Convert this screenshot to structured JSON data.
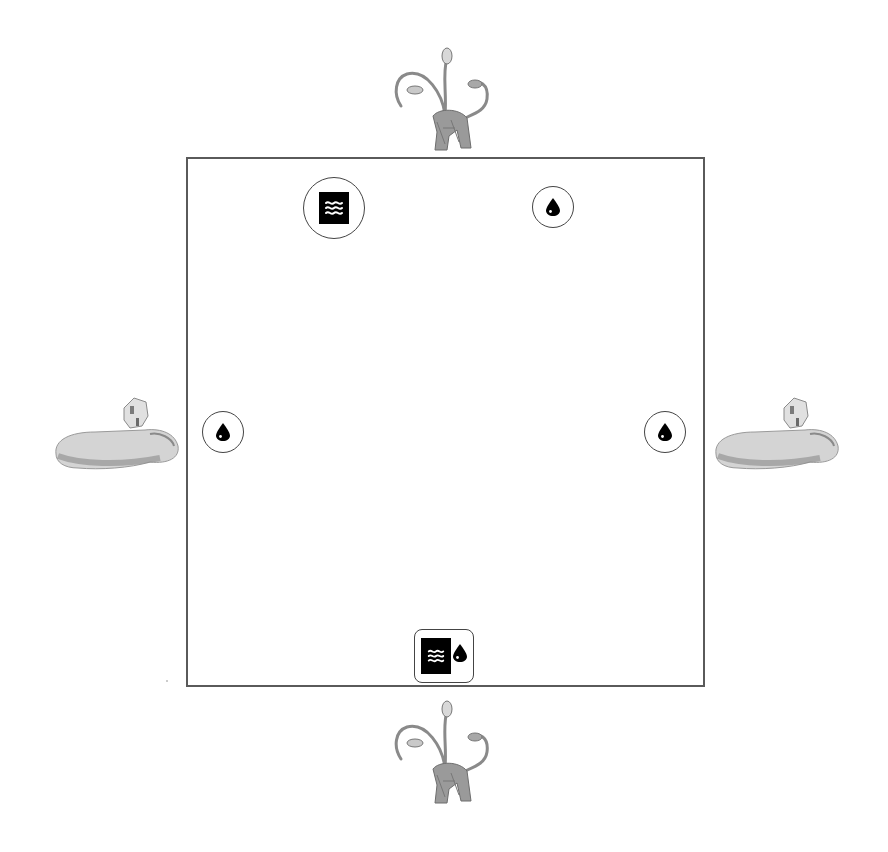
{
  "scene": {
    "type": "game-board",
    "background_color": "#ffffff",
    "board_border_color": "#5a5a5a",
    "token_color": "#000000"
  },
  "board": {
    "shape": "square",
    "bounds": {
      "x": 186,
      "y": 157,
      "width": 517,
      "height": 528
    }
  },
  "tokens": [
    {
      "id": "top-left",
      "icon": "water-waves-tile-icon",
      "frame": "circle",
      "x": 303,
      "y": 177,
      "size": 62
    },
    {
      "id": "top-right",
      "icon": "water-drop-icon",
      "frame": "circle",
      "x": 532,
      "y": 186,
      "size": 42
    },
    {
      "id": "left",
      "icon": "water-drop-icon",
      "frame": "circle",
      "x": 202,
      "y": 411,
      "size": 42
    },
    {
      "id": "right",
      "icon": "water-drop-icon",
      "frame": "circle",
      "x": 644,
      "y": 411,
      "size": 42
    },
    {
      "id": "bottom",
      "icon": "water-waves-and-drop-icon",
      "frame": "rounded-square",
      "x": 414,
      "y": 629,
      "size": 60
    }
  ],
  "monsters": [
    {
      "id": "top",
      "kind": "serpent-headed-beast",
      "x": 387,
      "y": 44,
      "width": 120,
      "height": 110
    },
    {
      "id": "bottom",
      "kind": "serpent-headed-beast",
      "x": 387,
      "y": 697,
      "width": 120,
      "height": 110
    },
    {
      "id": "left",
      "kind": "reclining-sphinx",
      "x": 50,
      "y": 392,
      "width": 135,
      "height": 85
    },
    {
      "id": "right",
      "kind": "reclining-sphinx",
      "x": 710,
      "y": 392,
      "width": 135,
      "height": 85
    }
  ]
}
